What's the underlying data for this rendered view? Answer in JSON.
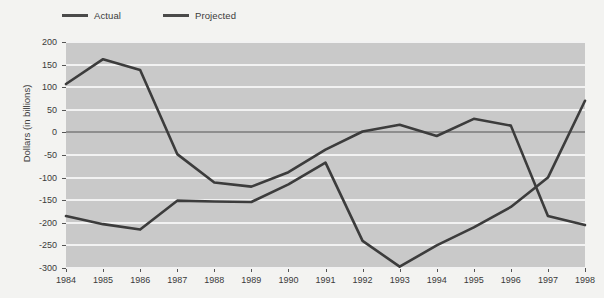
{
  "chart_data": {
    "type": "line",
    "title": "",
    "xlabel": "",
    "ylabel": "Dollars (in billions)",
    "x": [
      1984,
      1985,
      1986,
      1987,
      1988,
      1989,
      1990,
      1991,
      1992,
      1993,
      1994,
      1995,
      1996,
      1997,
      1998
    ],
    "xtick_labels": [
      "1984",
      "1985",
      "1986",
      "1987",
      "1988",
      "1989",
      "1990",
      "1991",
      "1992",
      "1993",
      "1994",
      "1995",
      "1996",
      "1997",
      "1998"
    ],
    "ytick_labels": [
      "200",
      "150",
      "100",
      "50",
      "0",
      "-50",
      "-100",
      "-150",
      "-200",
      "-250",
      "-300"
    ],
    "ytick_values": [
      200,
      150,
      100,
      50,
      0,
      -50,
      -100,
      -150,
      -200,
      -250,
      -300
    ],
    "ylim": [
      -300,
      200
    ],
    "xlim": [
      1984,
      1998
    ],
    "grid": true,
    "grid_color": "#f2f2f2",
    "zero_line": true,
    "zero_line_color": "#8e8e8e",
    "plot_background": "#c9c9c9",
    "figure_background": "#f3f3f1",
    "legend_position": "top-left",
    "series": [
      {
        "name": "Actual",
        "color": "#3c3c3c",
        "values": [
          -185,
          -203,
          -215,
          -151,
          -153,
          -154,
          -115,
          -67,
          -22,
          2,
          17,
          -8,
          30,
          15,
          20
        ]
      },
      {
        "name": "Projected",
        "color": "#3c3c3c",
        "values": [
          107,
          162,
          138,
          -48,
          -111,
          -120,
          -88,
          -38,
          2,
          17,
          -8,
          30,
          15,
          20,
          70
        ]
      }
    ],
    "rendered_paths": {
      "note": "Two crossing lines; the upper line starts high in 1984 and falls, the lower line starts low and rises.",
      "upper_line": [
        107,
        162,
        138,
        -48,
        -111,
        -120,
        -88,
        -38,
        2,
        17,
        -8,
        30,
        15,
        -185,
        -205
      ],
      "lower_line": [
        -185,
        -203,
        -215,
        -151,
        -153,
        -154,
        -115,
        -67,
        -240,
        -297,
        -250,
        -210,
        -165,
        -100,
        70
      ]
    }
  },
  "legend": {
    "items": [
      {
        "label": "Actual"
      },
      {
        "label": "Projected"
      }
    ]
  }
}
